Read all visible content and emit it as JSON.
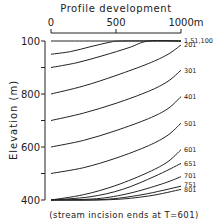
{
  "chart_data": {
    "type": "line",
    "title": "Profile development",
    "xlabel": "",
    "x_unit": "m",
    "ylabel": "Elevation (m)",
    "xlim": [
      0,
      1000
    ],
    "ylim": [
      400,
      1000
    ],
    "x_ticks": [
      {
        "value": 0,
        "label": "0"
      },
      {
        "value": 500,
        "label": "500"
      },
      {
        "value": 1000,
        "label": "1000"
      }
    ],
    "y_ticks": [
      {
        "value": 1000,
        "label": "100"
      },
      {
        "value": 900,
        "label": ""
      },
      {
        "value": 800,
        "label": "800"
      },
      {
        "value": 700,
        "label": ""
      },
      {
        "value": 600,
        "label": "600"
      },
      {
        "value": 500,
        "label": ""
      },
      {
        "value": 400,
        "label": "400"
      }
    ],
    "grid": false,
    "legend": "inline labels at right end of curves (time steps T)",
    "series": [
      {
        "name": "T=1",
        "x": [
          0,
          250,
          500,
          750,
          1000
        ],
        "y": [
          1000,
          1000,
          1000,
          1000,
          1000
        ]
      },
      {
        "name": "T=51",
        "x": [
          0,
          150,
          300,
          450,
          550,
          1000
        ],
        "y": [
          950,
          960,
          978,
          995,
          1000,
          1000
        ]
      },
      {
        "name": "T=100",
        "x": [
          0,
          200,
          400,
          600,
          750,
          1000
        ],
        "y": [
          900,
          918,
          945,
          975,
          1000,
          1000
        ]
      },
      {
        "name": "T=201",
        "x": [
          0,
          250,
          500,
          750,
          900,
          1000
        ],
        "y": [
          800,
          830,
          870,
          915,
          950,
          985
        ]
      },
      {
        "name": "T=301",
        "x": [
          0,
          250,
          500,
          750,
          900,
          1000
        ],
        "y": [
          700,
          728,
          765,
          810,
          848,
          890
        ]
      },
      {
        "name": "T=401",
        "x": [
          0,
          250,
          500,
          750,
          900,
          1000
        ],
        "y": [
          600,
          625,
          662,
          707,
          745,
          790
        ]
      },
      {
        "name": "T=501",
        "x": [
          0,
          250,
          500,
          750,
          900,
          1000
        ],
        "y": [
          500,
          522,
          558,
          605,
          645,
          690
        ]
      },
      {
        "name": "T=601",
        "x": [
          0,
          250,
          500,
          750,
          900,
          1000
        ],
        "y": [
          400,
          420,
          455,
          505,
          545,
          590
        ]
      },
      {
        "name": "T=651",
        "x": [
          0,
          300,
          550,
          800,
          1000
        ],
        "y": [
          400,
          412,
          440,
          490,
          538
        ]
      },
      {
        "name": "T=701",
        "x": [
          0,
          350,
          600,
          850,
          1000
        ],
        "y": [
          400,
          405,
          425,
          460,
          488
        ]
      },
      {
        "name": "T=751",
        "x": [
          0,
          400,
          700,
          1000
        ],
        "y": [
          400,
          402,
          420,
          452
        ]
      },
      {
        "name": "T=801",
        "x": [
          0,
          450,
          750,
          1000
        ],
        "y": [
          400,
          401,
          415,
          440
        ]
      }
    ],
    "curve_labels": [
      {
        "text": "1,51,100",
        "elev": 1003
      },
      {
        "text": "201",
        "elev": 985
      },
      {
        "text": "301",
        "elev": 890
      },
      {
        "text": "401",
        "elev": 790
      },
      {
        "text": "501",
        "elev": 690
      },
      {
        "text": "601",
        "elev": 590
      },
      {
        "text": "651",
        "elev": 538
      },
      {
        "text": "701",
        "elev": 492
      },
      {
        "text": "751",
        "elev": 458
      },
      {
        "text": "801",
        "elev": 440
      }
    ],
    "annotation": "(stream incision ends at T=601)"
  },
  "labels": {
    "title": "Profile development",
    "x_unit": "m",
    "y_axis": "Elevation (m)",
    "note": "(stream incision ends at T=601)"
  },
  "colors": {
    "ink": "#222222",
    "background": "#ffffff"
  }
}
